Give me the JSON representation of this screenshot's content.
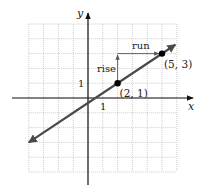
{
  "figure": {
    "type": "coordinate-plane"
  },
  "axes": {
    "x_label": "x",
    "y_label": "y",
    "x_tick_label": "1",
    "y_tick_label": "1",
    "grid": {
      "x_min": -4,
      "x_max": 6,
      "y_min": -5,
      "y_max": 5,
      "step": 1,
      "style": "dotted"
    }
  },
  "line": {
    "through": [
      [
        2,
        1
      ],
      [
        5,
        3
      ]
    ],
    "slope": "2/3",
    "extends_both_directions": true,
    "color": "#4a4a4a"
  },
  "points": [
    {
      "x": 2,
      "y": 1,
      "label": "(2, 1)"
    },
    {
      "x": 5,
      "y": 3,
      "label": "(5, 3)"
    }
  ],
  "annotations": {
    "rise_label": "rise",
    "run_label": "run"
  },
  "colors": {
    "grid": "#b8b8b8",
    "axis": "#111111",
    "line": "#4a4a4a",
    "point": "#000000"
  }
}
